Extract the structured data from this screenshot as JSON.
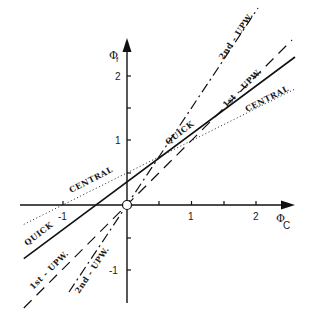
{
  "diagram": {
    "type": "normalized-variable-diagram",
    "axes": {
      "x_label": "Φ",
      "x_sub": "C",
      "y_label": "Φ",
      "y_sub": "f",
      "x_ticks": [
        {
          "value": -1,
          "label": "-1"
        },
        {
          "value": 0.5,
          "label": ""
        },
        {
          "value": 1,
          "label": "1"
        },
        {
          "value": 1.5,
          "label": ""
        },
        {
          "value": 2,
          "label": "2"
        }
      ],
      "y_ticks": [
        {
          "value": -1,
          "label": "-1"
        },
        {
          "value": -0.5,
          "label": ""
        },
        {
          "value": 0.5,
          "label": ""
        },
        {
          "value": 1,
          "label": "1"
        },
        {
          "value": 1.5,
          "label": ""
        },
        {
          "value": 2,
          "label": "2"
        }
      ],
      "origin_marker": "open-circle"
    },
    "curves": [
      {
        "name": "QUICK",
        "label": "QUICK",
        "style": "solid",
        "slope": 0.75,
        "intercept": 0.375
      },
      {
        "name": "CENTRAL",
        "label": "CENTRAL",
        "style": "dotted",
        "slope": 0.5,
        "intercept": 0.5
      },
      {
        "name": "1st-UPW",
        "label": "1st - UPW.",
        "style": "dashed",
        "slope": 1.0,
        "intercept": 0
      },
      {
        "name": "2nd-UPW",
        "label": "2nd - UPW.",
        "style": "dash-dot",
        "slope": 1.5,
        "intercept": 0
      }
    ],
    "labels": {
      "quick_upper": "QUICK",
      "quick_lower": "QUICK",
      "central_upper": "CENTRAL",
      "central_left": "CENTRAL",
      "upw1_upper": "1st - UPW.",
      "upw1_lower": "1st - UPW.",
      "upw2_upper": "2nd - UPW.",
      "upw2_lower": "2nd - UPW."
    }
  }
}
